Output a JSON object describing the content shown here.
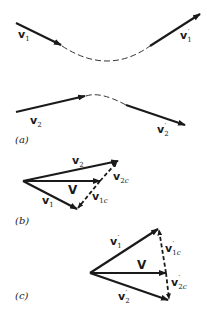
{
  "figure": {
    "panels": [
      {
        "id": "a",
        "label": "(a)"
      },
      {
        "id": "b",
        "label": "(b)"
      },
      {
        "id": "c",
        "label": "(c)"
      }
    ],
    "panel_a": {
      "v1": {
        "base": "v",
        "sub": "1",
        "prime": ""
      },
      "v1p": {
        "base": "v",
        "sub": "1",
        "prime": "′"
      },
      "v2": {
        "base": "v",
        "sub": "2",
        "prime": ""
      },
      "v2p": {
        "base": "v",
        "sub": "2",
        "prime": "′"
      }
    },
    "panel_b": {
      "v2": {
        "base": "v",
        "sub": "2"
      },
      "V": {
        "base": "V"
      },
      "v1": {
        "base": "v",
        "sub": "1"
      },
      "v2c": {
        "base": "v",
        "sub": "2",
        "subc": "c"
      },
      "v1c": {
        "base": "v",
        "sub": "1",
        "subc": "c"
      }
    },
    "panel_c": {
      "v1p": {
        "base": "v",
        "sub": "1",
        "prime": "′"
      },
      "V": {
        "base": "V"
      },
      "v2p": {
        "base": "v",
        "sub": "2",
        "prime": "′"
      },
      "v1cp": {
        "base": "v",
        "sub": "1",
        "subc": "c",
        "prime": "′"
      },
      "v2cp": {
        "base": "v",
        "sub": "2",
        "subc": "c",
        "prime": "′"
      }
    }
  }
}
